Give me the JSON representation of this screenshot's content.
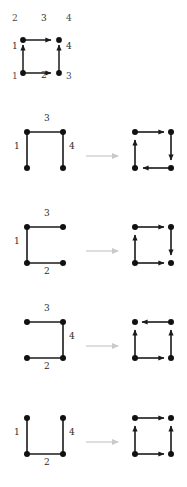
{
  "figure": {
    "background": "#ffffff",
    "edge_color": "#1a1a1a",
    "node_color": "#111111",
    "label_color": "#2b2b2b",
    "vertex_label_color": "#4a4a4a",
    "transition_arrow_color": "#c9c9c9"
  },
  "top_diagram": {
    "name": "labeled-square-graph",
    "vertex_labels": {
      "bottom_left": "1",
      "top_left": "2",
      "bottom_right": "3",
      "top_right": "4"
    },
    "edge_labels": {
      "left": "1",
      "bottom": "2",
      "top": "3",
      "right": "4"
    },
    "edges": [
      {
        "id": "left",
        "label": "1",
        "direction": "up",
        "present": true
      },
      {
        "id": "bottom",
        "label": "2",
        "direction": "right",
        "present": true
      },
      {
        "id": "top",
        "label": "3",
        "direction": "right",
        "present": true
      },
      {
        "id": "right",
        "label": "4",
        "direction": "up",
        "present": true
      }
    ]
  },
  "rows": [
    {
      "name": "row-missing-bottom-edge",
      "source": {
        "edges": [
          {
            "id": "left",
            "label": "1",
            "present": true
          },
          {
            "id": "top",
            "label": "3",
            "present": true
          },
          {
            "id": "right",
            "label": "4",
            "present": true
          },
          {
            "id": "bottom",
            "label": "",
            "present": false
          }
        ]
      },
      "arrow": "transition-arrow",
      "result": {
        "edges": [
          {
            "id": "top",
            "direction": "right"
          },
          {
            "id": "right",
            "direction": "down"
          },
          {
            "id": "bottom",
            "direction": "left"
          },
          {
            "id": "left",
            "direction": "up"
          }
        ]
      }
    },
    {
      "name": "row-missing-right-edge",
      "source": {
        "edges": [
          {
            "id": "left",
            "label": "1",
            "present": true
          },
          {
            "id": "top",
            "label": "3",
            "present": true
          },
          {
            "id": "bottom",
            "label": "2",
            "present": true
          },
          {
            "id": "right",
            "label": "",
            "present": false
          }
        ]
      },
      "arrow": "transition-arrow",
      "result": {
        "edges": [
          {
            "id": "top",
            "direction": "right"
          },
          {
            "id": "right",
            "direction": "down"
          },
          {
            "id": "bottom",
            "direction": "right"
          },
          {
            "id": "left",
            "direction": "up"
          }
        ]
      }
    },
    {
      "name": "row-missing-left-edge",
      "source": {
        "edges": [
          {
            "id": "top",
            "label": "3",
            "present": true
          },
          {
            "id": "right",
            "label": "4",
            "present": true
          },
          {
            "id": "bottom",
            "label": "2",
            "present": true
          },
          {
            "id": "left",
            "label": "",
            "present": false
          }
        ]
      },
      "arrow": "transition-arrow",
      "result": {
        "edges": [
          {
            "id": "top",
            "direction": "left"
          },
          {
            "id": "right",
            "direction": "up"
          },
          {
            "id": "bottom",
            "direction": "right"
          },
          {
            "id": "left",
            "direction": "up"
          }
        ]
      }
    },
    {
      "name": "row-missing-top-edge",
      "source": {
        "edges": [
          {
            "id": "left",
            "label": "1",
            "present": true
          },
          {
            "id": "bottom",
            "label": "2",
            "present": true
          },
          {
            "id": "right",
            "label": "4",
            "present": true
          },
          {
            "id": "top",
            "label": "",
            "present": false
          }
        ]
      },
      "arrow": "transition-arrow",
      "result": {
        "edges": [
          {
            "id": "top",
            "direction": "right"
          },
          {
            "id": "right",
            "direction": "up"
          },
          {
            "id": "bottom",
            "direction": "right"
          },
          {
            "id": "left",
            "direction": "up"
          }
        ]
      }
    }
  ]
}
